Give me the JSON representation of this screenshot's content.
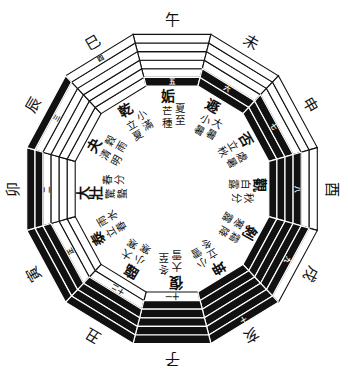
{
  "diagram": {
    "sectors": [
      {
        "branch": "午",
        "hexagram": "姤",
        "terms": [
          "芒種",
          "夏至"
        ],
        "month_mark": "五",
        "lines_inner_to_outer": [
          "yin",
          "yang",
          "yang",
          "yang",
          "yang",
          "yang"
        ]
      },
      {
        "branch": "未",
        "hexagram": "遯",
        "terms": [
          "小暑",
          "大暑"
        ],
        "month_mark": "六",
        "lines_inner_to_outer": [
          "yin",
          "yin",
          "yang",
          "yang",
          "yang",
          "yang"
        ]
      },
      {
        "branch": "申",
        "hexagram": "否",
        "terms": [
          "立秋",
          "處暑"
        ],
        "month_mark": "七",
        "lines_inner_to_outer": [
          "yin",
          "yin",
          "yin",
          "yang",
          "yang",
          "yang"
        ]
      },
      {
        "branch": "酉",
        "hexagram": "觀",
        "terms": [
          "白露",
          "秋分"
        ],
        "month_mark": "八",
        "lines_inner_to_outer": [
          "yin",
          "yin",
          "yin",
          "yin",
          "yang",
          "yang"
        ]
      },
      {
        "branch": "戌",
        "hexagram": "剝",
        "terms": [
          "寒露",
          "霜降"
        ],
        "month_mark": "九",
        "lines_inner_to_outer": [
          "yin",
          "yin",
          "yin",
          "yin",
          "yin",
          "yang"
        ]
      },
      {
        "branch": "亥",
        "hexagram": "坤",
        "terms": [
          "立冬",
          "小雪"
        ],
        "month_mark": "十",
        "lines_inner_to_outer": [
          "yin",
          "yin",
          "yin",
          "yin",
          "yin",
          "yin"
        ]
      },
      {
        "branch": "子",
        "hexagram": "復",
        "terms": [
          "大雪",
          "冬至"
        ],
        "month_mark": "十一",
        "lines_inner_to_outer": [
          "yang",
          "yin",
          "yin",
          "yin",
          "yin",
          "yin"
        ]
      },
      {
        "branch": "丑",
        "hexagram": "臨",
        "terms": [
          "小寒",
          "大寒"
        ],
        "month_mark": "十二",
        "lines_inner_to_outer": [
          "yang",
          "yang",
          "yin",
          "yin",
          "yin",
          "yin"
        ]
      },
      {
        "branch": "寅",
        "hexagram": "泰",
        "terms": [
          "立春",
          "雨水"
        ],
        "month_mark": "正",
        "lines_inner_to_outer": [
          "yang",
          "yang",
          "yang",
          "yin",
          "yin",
          "yin"
        ]
      },
      {
        "branch": "卯",
        "hexagram": "大壯",
        "terms": [
          "驚蟄",
          "春分"
        ],
        "month_mark": "二",
        "lines_inner_to_outer": [
          "yang",
          "yang",
          "yang",
          "yang",
          "yin",
          "yin"
        ]
      },
      {
        "branch": "辰",
        "hexagram": "夬",
        "terms": [
          "清明",
          "穀雨"
        ],
        "month_mark": "三",
        "lines_inner_to_outer": [
          "yang",
          "yang",
          "yang",
          "yang",
          "yang",
          "yin"
        ]
      },
      {
        "branch": "巳",
        "hexagram": "乾",
        "terms": [
          "立夏",
          "小滿"
        ],
        "month_mark": "四",
        "lines_inner_to_outer": [
          "yang",
          "yang",
          "yang",
          "yang",
          "yang",
          "yang"
        ]
      }
    ]
  },
  "colors": {
    "ink": "#111111",
    "paper": "#ffffff"
  }
}
